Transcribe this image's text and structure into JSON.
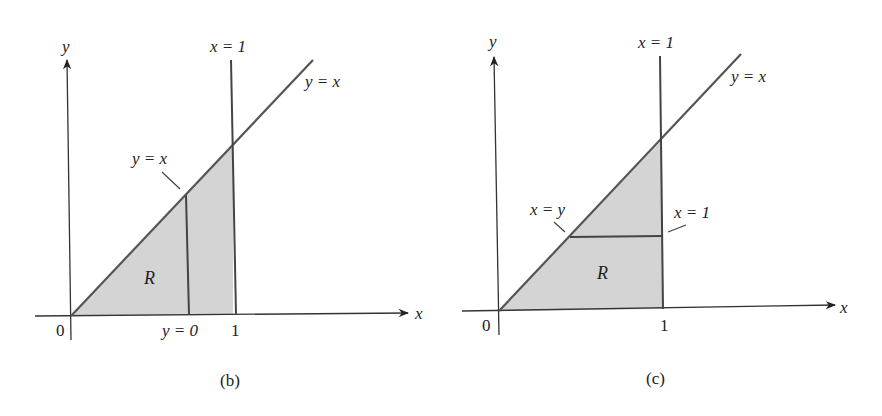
{
  "figures": [
    {
      "id": "b",
      "caption": "(b)",
      "axes": {
        "x_label": "x",
        "y_label": "y",
        "origin_label": "0",
        "x_tick_label": "1"
      },
      "region_label": "R",
      "curves": [
        {
          "name": "diagonal",
          "label": "y = x"
        },
        {
          "name": "vertical-boundary",
          "label": "x = 1"
        }
      ],
      "annotations": {
        "slice_top_label": "y = x",
        "slice_bottom_label": "y = 0"
      },
      "slice": "vertical"
    },
    {
      "id": "c",
      "caption": "(c)",
      "axes": {
        "x_label": "x",
        "y_label": "y",
        "origin_label": "0",
        "x_tick_label": "1"
      },
      "region_label": "R",
      "curves": [
        {
          "name": "diagonal",
          "label": "y = x"
        },
        {
          "name": "vertical-boundary",
          "label": "x = 1"
        }
      ],
      "annotations": {
        "slice_left_label": "x = y",
        "slice_right_label": "x = 1"
      },
      "slice": "horizontal"
    }
  ],
  "colors": {
    "region_fill": "#d4d4d4",
    "line": "#555555",
    "text": "#222222"
  }
}
